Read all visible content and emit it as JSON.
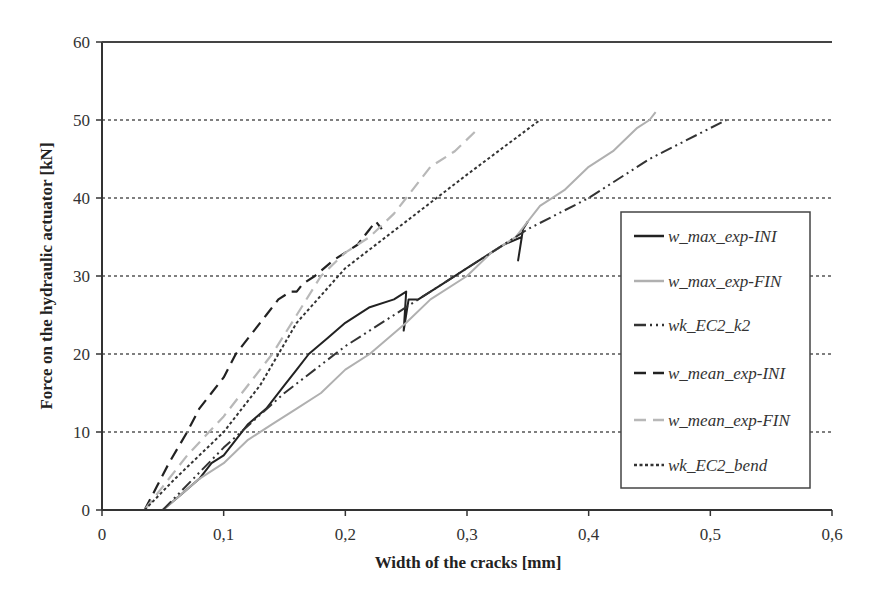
{
  "chart_data": {
    "type": "line",
    "title": "",
    "xlabel": "Width of the cracks [mm]",
    "ylabel": "Force on the hydraulic actuator [kN]",
    "xlim": [
      0,
      0.6
    ],
    "ylim": [
      0,
      60
    ],
    "xticks": [
      "0",
      "0,1",
      "0,2",
      "0,3",
      "0,4",
      "0,5",
      "0,6"
    ],
    "yticks": [
      "0",
      "10",
      "20",
      "30",
      "40",
      "50",
      "60"
    ],
    "grid": "horizontal dotted",
    "legend_position": "right inside",
    "series": [
      {
        "name": "w_max_exp-INI",
        "color": "#222222",
        "dash": "solid",
        "width": 2,
        "x": [
          0.05,
          0.065,
          0.08,
          0.09,
          0.1,
          0.11,
          0.12,
          0.135,
          0.15,
          0.16,
          0.17,
          0.185,
          0.2,
          0.22,
          0.24,
          0.25,
          0.248,
          0.252,
          0.26,
          0.28,
          0.3,
          0.32,
          0.33,
          0.345,
          0.342,
          0.346,
          0.35
        ],
        "y": [
          0,
          2,
          4,
          6,
          7,
          9,
          11,
          13,
          16,
          18,
          20,
          22,
          24,
          26,
          27,
          28,
          23,
          27,
          27,
          29,
          31,
          33,
          34,
          35,
          32,
          36,
          37
        ]
      },
      {
        "name": "w_max_exp-FIN",
        "color": "#b0b0b0",
        "dash": "solid",
        "width": 2,
        "x": [
          0.05,
          0.065,
          0.08,
          0.1,
          0.12,
          0.14,
          0.16,
          0.18,
          0.2,
          0.22,
          0.25,
          0.27,
          0.3,
          0.32,
          0.34,
          0.36,
          0.38,
          0.4,
          0.42,
          0.44,
          0.45,
          0.455
        ],
        "y": [
          0,
          2,
          4,
          6,
          9,
          11,
          13,
          15,
          18,
          20,
          24,
          27,
          30,
          33,
          35,
          39,
          41,
          44,
          46,
          49,
          50,
          51
        ]
      },
      {
        "name": "wk_EC2_k2",
        "color": "#333333",
        "dash": "dashdotdot",
        "width": 2,
        "x": [
          0.05,
          0.1,
          0.15,
          0.2,
          0.25,
          0.3,
          0.35,
          0.4,
          0.45,
          0.513
        ],
        "y": [
          0,
          8,
          15,
          21,
          26,
          31,
          36,
          40,
          45,
          50
        ]
      },
      {
        "name": "w_mean_exp-INI",
        "color": "#222222",
        "dash": "longdash",
        "width": 2.2,
        "x": [
          0.035,
          0.045,
          0.055,
          0.07,
          0.08,
          0.09,
          0.1,
          0.11,
          0.12,
          0.135,
          0.145,
          0.155,
          0.16,
          0.165,
          0.175,
          0.19,
          0.2,
          0.21,
          0.22,
          0.215,
          0.225,
          0.23
        ],
        "y": [
          0,
          3,
          6,
          10,
          13,
          15,
          17,
          20,
          22,
          25,
          27,
          28,
          28,
          29,
          30,
          32,
          33,
          34,
          36,
          35,
          37,
          36
        ]
      },
      {
        "name": "w_mean_exp-FIN",
        "color": "#b8b8b8",
        "dash": "longdash",
        "width": 2.2,
        "x": [
          0.035,
          0.05,
          0.07,
          0.1,
          0.12,
          0.14,
          0.16,
          0.18,
          0.2,
          0.22,
          0.24,
          0.25,
          0.27,
          0.29,
          0.31
        ],
        "y": [
          0,
          3,
          7,
          12,
          16,
          20,
          25,
          30,
          33,
          35,
          38,
          40,
          44,
          46,
          49
        ]
      },
      {
        "name": "wk_EC2_bend",
        "color": "#333333",
        "dash": "dotted",
        "width": 2,
        "x": [
          0.035,
          0.06,
          0.1,
          0.13,
          0.16,
          0.2,
          0.25,
          0.3,
          0.36
        ],
        "y": [
          0,
          4,
          10,
          16,
          24,
          31,
          37,
          43,
          50
        ]
      }
    ]
  },
  "legend": {
    "items": [
      {
        "label": "w_max_exp-INI"
      },
      {
        "label": "w_max_exp-FIN"
      },
      {
        "label": "wk_EC2_k2"
      },
      {
        "label": "w_mean_exp-INI"
      },
      {
        "label": "w_mean_exp-FIN"
      },
      {
        "label": "wk_EC2_bend"
      }
    ]
  },
  "axes": {
    "x_title": "Width of the cracks [mm]",
    "y_title": "Force on the hydraulic actuator [kN]"
  }
}
